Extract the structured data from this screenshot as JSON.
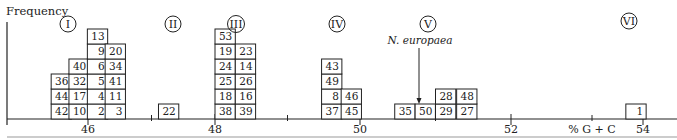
{
  "chart_data": {
    "type": "bar",
    "subtype": "stacked-unit-histogram",
    "title": "",
    "xlabel": "% G + C",
    "ylabel": "Frequency",
    "xlim": [
      45.1,
      55.4
    ],
    "x_tick_labels": [
      "46",
      "48",
      "50",
      "52",
      "54"
    ],
    "x_major_ticks": [
      46,
      48,
      50,
      52,
      54
    ],
    "x_minor_ticks": [
      47,
      49,
      51,
      53
    ],
    "bin_width": 0.28,
    "groups": [
      {
        "label": "I",
        "columns": [
          {
            "x_start": 45.42,
            "values": [
              42,
              44,
              36
            ]
          },
          {
            "x_start": 45.7,
            "values": [
              10,
              17,
              32,
              40
            ]
          },
          {
            "x_start": 45.99,
            "values": [
              2,
              4,
              5,
              6,
              9,
              13
            ]
          },
          {
            "x_start": 46.27,
            "values": [
              3,
              11,
              41,
              34,
              20
            ]
          }
        ]
      },
      {
        "label": "II",
        "columns": [
          {
            "x_start": 47.11,
            "values": [
              22
            ]
          }
        ]
      },
      {
        "label": "III",
        "columns": [
          {
            "x_start": 48.0,
            "values": [
              38,
              18,
              25,
              24,
              19,
              53
            ]
          },
          {
            "x_start": 48.28,
            "values": [
              39,
              16,
              26,
              14,
              23
            ]
          }
        ]
      },
      {
        "label": "IV",
        "columns": [
          {
            "x_start": 49.47,
            "values": [
              37,
              8,
              49,
              43
            ]
          },
          {
            "x_start": 49.74,
            "values": [
              45,
              46
            ]
          }
        ]
      },
      {
        "label": "V",
        "columns": [
          {
            "x_start": 50.46,
            "values": [
              35
            ]
          },
          {
            "x_start": 50.73,
            "values": [
              50
            ]
          },
          {
            "x_start": 51.0,
            "values": [
              29,
              28
            ]
          },
          {
            "x_start": 51.28,
            "values": [
              27,
              48
            ]
          }
        ]
      },
      {
        "label": "VI",
        "columns": [
          {
            "x_start": 53.74,
            "values": [
              1
            ]
          }
        ]
      }
    ],
    "counts_per_column": [
      3,
      4,
      6,
      5,
      1,
      6,
      5,
      4,
      2,
      1,
      1,
      2,
      2,
      1
    ],
    "annotations": [
      {
        "text": "N. europaea",
        "style": "italic",
        "arrow_to_x": 50.85,
        "points_to_value": 50
      }
    ],
    "grid": false,
    "legend": "none"
  }
}
